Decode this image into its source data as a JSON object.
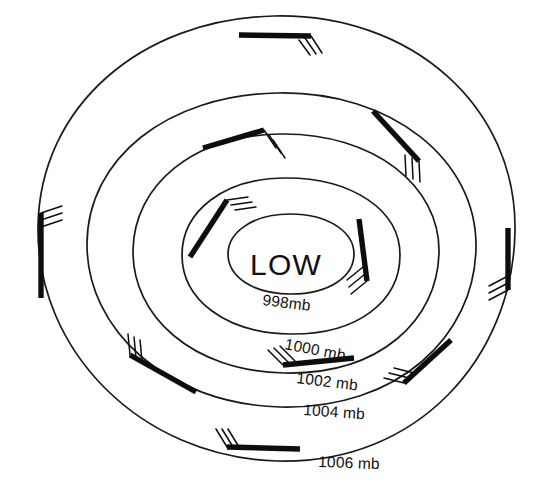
{
  "diagram": {
    "title": "LOW",
    "center_label": "LOW",
    "type": "isobar-pressure-map",
    "background_color": "#ffffff",
    "line_color": "#1a1a1a",
    "barb_color": "#0d0d0d"
  },
  "isobars": [
    {
      "id": "isobar-998",
      "label": "998mb",
      "value": 998,
      "label_x": 262,
      "label_y": 305,
      "label_rotate": 7,
      "path": "M 290 214 C 252 214 228 233 228 254 C 228 276 252 294 291 294 C 330 294 354 276 354 254 C 354 233 330 214 290 214 Z"
    },
    {
      "id": "isobar-1000",
      "label": "1000 mb",
      "value": 1000,
      "label_x": 284,
      "label_y": 349,
      "label_rotate": 11,
      "path": "M 286 178 C 224 178 182 211 182 255 C 182 300 226 333 290 334 C 358 335 400 301 400 255 C 400 210 352 178 286 178 Z"
    },
    {
      "id": "isobar-1002",
      "label": "1002 mb",
      "value": 1002,
      "label_x": 296,
      "label_y": 383,
      "label_rotate": 7,
      "path": "M 281 134 C 192 135 134 186 133 250 C 132 316 192 371 284 373 C 380 375 438 320 439 252 C 440 186 374 133 281 134 Z"
    },
    {
      "id": "isobar-1004",
      "label": "1004 mb",
      "value": 1004,
      "label_x": 303,
      "label_y": 415,
      "label_rotate": 4,
      "path": "M 278 93 C 166 95 88 159 87 243 C 86 330 168 404 280 407 C 398 410 475 336 476 247 C 477 160 392 91 278 93 Z"
    },
    {
      "id": "isobar-1006",
      "label": "1006 mb",
      "value": 1006,
      "label_x": 318,
      "label_y": 467,
      "label_rotate": 2,
      "path": "M 274 16 C 140 19 40 107 38 226 C 36 350 140 457 277 461 C 418 465 513 357 515 231 C 517 107 412 13 274 16 Z"
    }
  ],
  "wind_barbs": [
    {
      "id": "barb-north",
      "description": "north-outer-barb",
      "shaft": [
        239,
        35,
        311,
        36
      ],
      "feathers": [
        [
          311,
          36,
          322,
          53
        ],
        [
          305,
          38,
          316,
          54
        ],
        [
          299,
          40,
          310,
          55
        ]
      ]
    },
    {
      "id": "barb-northeast",
      "description": "northeast-barb",
      "shaft": [
        373,
        111,
        419,
        161
      ],
      "feathers": [
        [
          419,
          161,
          420,
          182
        ],
        [
          412,
          158,
          413,
          179
        ],
        [
          405,
          155,
          406,
          176
        ]
      ]
    },
    {
      "id": "barb-east",
      "description": "east-outer-barb",
      "shaft": [
        508,
        228,
        508,
        290
      ],
      "feathers": [
        [
          508,
          290,
          489,
          300
        ],
        [
          508,
          283,
          489,
          293
        ],
        [
          508,
          276,
          489,
          286
        ]
      ]
    },
    {
      "id": "barb-west",
      "description": "west-outer-barb",
      "shaft": [
        41,
        213,
        41,
        298
      ],
      "feathers": [
        [
          41,
          213,
          62,
          206
        ],
        [
          41,
          220,
          62,
          213
        ],
        [
          41,
          227,
          62,
          220
        ]
      ]
    },
    {
      "id": "barb-inner-north",
      "description": "inner-north-barb",
      "shaft": [
        203,
        148,
        264,
        130
      ],
      "feathers": [
        [
          264,
          130,
          276,
          148
        ],
        [
          269,
          135,
          281,
          153
        ],
        [
          273,
          140,
          285,
          158
        ]
      ]
    },
    {
      "id": "barb-inner-northwest",
      "description": "inner-northwest-barb",
      "shaft": [
        190,
        257,
        227,
        200
      ],
      "feathers": [
        [
          227,
          200,
          248,
          197
        ],
        [
          231,
          205,
          252,
          202
        ],
        [
          235,
          210,
          256,
          207
        ]
      ]
    },
    {
      "id": "barb-inner-east",
      "description": "inner-east-barb",
      "shaft": [
        359,
        219,
        367,
        281
      ],
      "feathers": [
        [
          367,
          281,
          351,
          294
        ],
        [
          365,
          274,
          349,
          287
        ],
        [
          363,
          267,
          347,
          280
        ]
      ]
    },
    {
      "id": "barb-southwest",
      "description": "southwest-barb",
      "shaft": [
        130,
        355,
        196,
        392
      ],
      "feathers": [
        [
          130,
          355,
          128,
          334
        ],
        [
          136,
          358,
          134,
          337
        ],
        [
          142,
          361,
          140,
          340
        ]
      ]
    },
    {
      "id": "barb-inner-south",
      "description": "inner-south-barb",
      "shaft": [
        283,
        365,
        354,
        358
      ],
      "feathers": [
        [
          283,
          365,
          268,
          350
        ],
        [
          289,
          363,
          274,
          348
        ],
        [
          295,
          361,
          280,
          346
        ]
      ]
    },
    {
      "id": "barb-southeast",
      "description": "southeast-barb",
      "shaft": [
        404,
        383,
        451,
        340
      ],
      "feathers": [
        [
          404,
          383,
          384,
          378
        ],
        [
          409,
          378,
          389,
          373
        ],
        [
          414,
          373,
          394,
          368
        ]
      ]
    },
    {
      "id": "barb-south",
      "description": "south-outer-barb",
      "shaft": [
        227,
        447,
        300,
        449
      ],
      "feathers": [
        [
          227,
          447,
          216,
          429
        ],
        [
          233,
          447,
          222,
          429
        ],
        [
          239,
          447,
          228,
          429
        ]
      ]
    }
  ],
  "chart_data": {
    "type": "contour-map",
    "title": "LOW",
    "center": "LOW",
    "contour_labels": [
      "998mb",
      "1000 mb",
      "1002 mb",
      "1004 mb",
      "1006 mb"
    ],
    "contour_values": [
      998,
      1000,
      1002,
      1004,
      1006
    ],
    "units": "mb",
    "barb_count": 11,
    "barbs_per_station": 3,
    "circulation": "counterclockwise"
  }
}
